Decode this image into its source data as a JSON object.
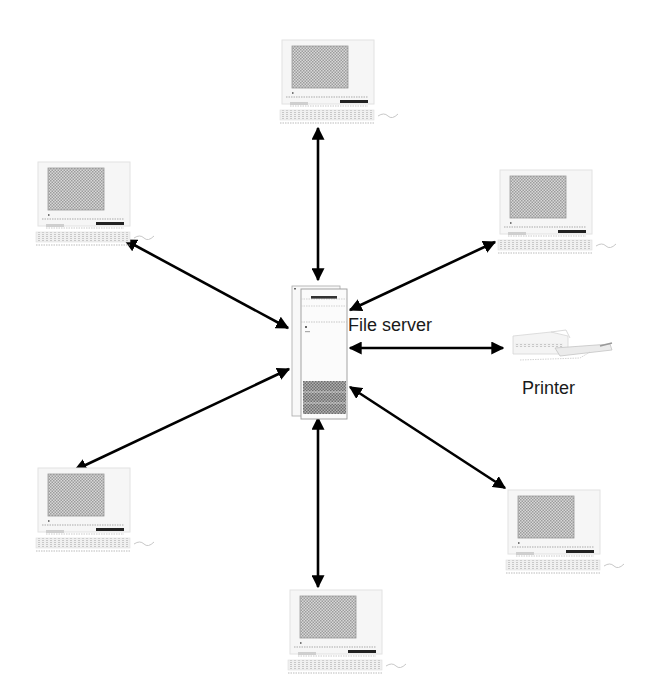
{
  "diagram": {
    "type": "star-network",
    "center": {
      "id": "server",
      "label": "File server"
    },
    "nodes": [
      {
        "id": "pc-top",
        "kind": "workstation",
        "x": 275,
        "y": 38
      },
      {
        "id": "pc-upper-left",
        "kind": "workstation",
        "x": 33,
        "y": 160
      },
      {
        "id": "pc-upper-right",
        "kind": "workstation",
        "x": 495,
        "y": 168
      },
      {
        "id": "printer",
        "kind": "printer",
        "label": "Printer",
        "x": 512,
        "y": 325
      },
      {
        "id": "pc-lower-left",
        "kind": "workstation",
        "x": 30,
        "y": 465
      },
      {
        "id": "pc-lower-right",
        "kind": "workstation",
        "x": 495,
        "y": 485
      },
      {
        "id": "pc-bottom",
        "kind": "workstation",
        "x": 280,
        "y": 580
      }
    ],
    "edges": [
      {
        "from": "server",
        "to": "pc-top",
        "x1": 318,
        "y1": 280,
        "x2": 318,
        "y2": 128,
        "bidirectional": true
      },
      {
        "from": "server",
        "to": "pc-upper-left",
        "x1": 288,
        "y1": 328,
        "x2": 125,
        "y2": 240,
        "bidirectional": true
      },
      {
        "from": "server",
        "to": "pc-upper-right",
        "x1": 349,
        "y1": 310,
        "x2": 495,
        "y2": 242,
        "bidirectional": true
      },
      {
        "from": "server",
        "to": "printer",
        "x1": 349,
        "y1": 348,
        "x2": 503,
        "y2": 348,
        "bidirectional": true
      },
      {
        "from": "server",
        "to": "pc-lower-left",
        "x1": 289,
        "y1": 369,
        "x2": 75,
        "y2": 470,
        "bidirectional": true
      },
      {
        "from": "server",
        "to": "pc-lower-right",
        "x1": 349,
        "y1": 387,
        "x2": 505,
        "y2": 488,
        "bidirectional": true
      },
      {
        "from": "server",
        "to": "pc-bottom",
        "x1": 318,
        "y1": 418,
        "x2": 318,
        "y2": 587,
        "bidirectional": true
      }
    ],
    "colors": {
      "arrow": "#000000",
      "screen": "#b8b8b8",
      "outline": "#9a9a9a",
      "text": "#1a1a1a"
    }
  }
}
